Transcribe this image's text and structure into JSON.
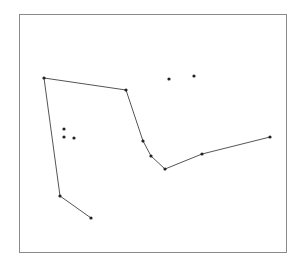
{
  "frame": {
    "x": 19,
    "y": 14,
    "width": 267,
    "height": 238,
    "stroke": "#8a8a8a"
  },
  "style": {
    "line_color": "#555555",
    "point_color": "#222222",
    "point_radius": 1.6
  },
  "polylines": [
    {
      "name": "left-chain",
      "points": [
        [
          91,
          218
        ],
        [
          60,
          196
        ],
        [
          44,
          78
        ],
        [
          126,
          90
        ],
        [
          143,
          141
        ],
        [
          151,
          156
        ],
        [
          165,
          169
        ],
        [
          202,
          154
        ],
        [
          270,
          137
        ]
      ]
    }
  ],
  "isolated_points": [
    [
      64,
      129
    ],
    [
      64,
      137
    ],
    [
      74,
      138
    ],
    [
      169,
      79
    ],
    [
      194,
      76
    ]
  ]
}
